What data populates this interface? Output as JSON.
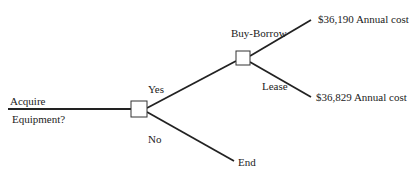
{
  "diagram": {
    "type": "decision-tree",
    "root_label_line1": "Acquire",
    "root_label_line2": "Equipment?",
    "branch_yes": "Yes",
    "branch_no": "No",
    "no_outcome": "End",
    "sub_branch_buy": "Buy-Borrow",
    "sub_branch_lease": "Lease",
    "outcome_buy": "$36,190 Annual cost",
    "outcome_lease": "$36,829 Annual cost"
  }
}
